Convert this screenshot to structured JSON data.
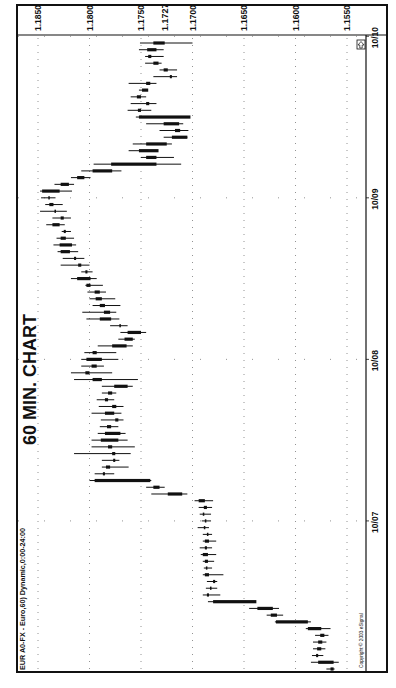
{
  "title": "60 MIN. CHART",
  "symbol_label": "EUR A0-FX - Euro,60) Dynamic,0:00-24:00",
  "copyright": "Copyright © 2003 eSignal",
  "last_price_marker": "1.1727",
  "colors": {
    "ink": "#111111",
    "grid": "#777777",
    "background": "#ffffff"
  },
  "chart_data": {
    "type": "ohlc",
    "title": "60 MIN. CHART",
    "subtitle": "EUR A0-FX - Euro,60) Dynamic,0:00-24:00",
    "xlabel": "Date",
    "ylabel": "EUR/USD",
    "orientation": "rotated 90° counter-clockwise (time runs bottom→top, price decreases left→right)",
    "ylim": [
      1.153,
      1.187
    ],
    "price_ticks": [
      "1.1850",
      "1.1800",
      "1.1750",
      "1.1700",
      "1.1650",
      "1.1600",
      "1.1550"
    ],
    "last_price": 1.1727,
    "date_ticks": [
      "10/07",
      "10/08",
      "10/09",
      "10/10"
    ],
    "grid": true,
    "legend": null,
    "bars": [
      {
        "o": 1.1566,
        "h": 1.157,
        "l": 1.1562,
        "c": 1.1563
      },
      {
        "o": 1.1563,
        "h": 1.1585,
        "l": 1.1558,
        "c": 1.1578
      },
      {
        "o": 1.158,
        "h": 1.1584,
        "l": 1.1573,
        "c": 1.1578
      },
      {
        "o": 1.1575,
        "h": 1.1583,
        "l": 1.1571,
        "c": 1.1579
      },
      {
        "o": 1.1578,
        "h": 1.1583,
        "l": 1.157,
        "c": 1.1574
      },
      {
        "o": 1.1572,
        "h": 1.1581,
        "l": 1.1568,
        "c": 1.1576
      },
      {
        "o": 1.1575,
        "h": 1.159,
        "l": 1.1566,
        "c": 1.1588
      },
      {
        "o": 1.1588,
        "h": 1.162,
        "l": 1.1585,
        "c": 1.1619
      },
      {
        "o": 1.1618,
        "h": 1.1628,
        "l": 1.1612,
        "c": 1.1624
      },
      {
        "o": 1.1622,
        "h": 1.1645,
        "l": 1.1616,
        "c": 1.1637
      },
      {
        "o": 1.1638,
        "h": 1.1685,
        "l": 1.1678,
        "c": 1.168
      },
      {
        "o": 1.1684,
        "h": 1.169,
        "l": 1.1673,
        "c": 1.1686
      },
      {
        "o": 1.1683,
        "h": 1.1687,
        "l": 1.1676,
        "c": 1.1682
      },
      {
        "o": 1.168,
        "h": 1.1686,
        "l": 1.1676,
        "c": 1.1678
      },
      {
        "o": 1.1684,
        "h": 1.169,
        "l": 1.167,
        "c": 1.1688
      },
      {
        "o": 1.1686,
        "h": 1.1689,
        "l": 1.1681,
        "c": 1.1687
      },
      {
        "o": 1.1685,
        "h": 1.169,
        "l": 1.1679,
        "c": 1.1688
      },
      {
        "o": 1.1685,
        "h": 1.1692,
        "l": 1.1677,
        "c": 1.169
      },
      {
        "o": 1.1686,
        "h": 1.1693,
        "l": 1.1681,
        "c": 1.1688
      },
      {
        "o": 1.1684,
        "h": 1.169,
        "l": 1.1677,
        "c": 1.1688
      },
      {
        "o": 1.1686,
        "h": 1.169,
        "l": 1.1681,
        "c": 1.1686
      },
      {
        "o": 1.1688,
        "h": 1.1695,
        "l": 1.1684,
        "c": 1.1689
      },
      {
        "o": 1.1688,
        "h": 1.1691,
        "l": 1.1682,
        "c": 1.1687
      },
      {
        "o": 1.1689,
        "h": 1.1693,
        "l": 1.1682,
        "c": 1.169
      },
      {
        "o": 1.1686,
        "h": 1.1694,
        "l": 1.1681,
        "c": 1.1689
      },
      {
        "o": 1.1688,
        "h": 1.1698,
        "l": 1.168,
        "c": 1.1694
      },
      {
        "o": 1.171,
        "h": 1.174,
        "l": 1.1705,
        "c": 1.1724
      },
      {
        "o": 1.1738,
        "h": 1.1745,
        "l": 1.1727,
        "c": 1.1732
      },
      {
        "o": 1.1795,
        "h": 1.18,
        "l": 1.174,
        "c": 1.1741
      },
      {
        "o": 1.1787,
        "h": 1.1795,
        "l": 1.1776,
        "c": 1.1785
      },
      {
        "o": 1.178,
        "h": 1.1788,
        "l": 1.1762,
        "c": 1.1784
      },
      {
        "o": 1.1775,
        "h": 1.1788,
        "l": 1.1771,
        "c": 1.1777
      },
      {
        "o": 1.1778,
        "h": 1.1815,
        "l": 1.176,
        "c": 1.1775
      },
      {
        "o": 1.1778,
        "h": 1.1798,
        "l": 1.1756,
        "c": 1.1782
      },
      {
        "o": 1.1789,
        "h": 1.1798,
        "l": 1.1763,
        "c": 1.1772
      },
      {
        "o": 1.177,
        "h": 1.1792,
        "l": 1.1765,
        "c": 1.1785
      },
      {
        "o": 1.1783,
        "h": 1.179,
        "l": 1.1772,
        "c": 1.1779
      },
      {
        "o": 1.1772,
        "h": 1.1789,
        "l": 1.1767,
        "c": 1.1775
      },
      {
        "o": 1.1785,
        "h": 1.1798,
        "l": 1.1769,
        "c": 1.1776
      },
      {
        "o": 1.1774,
        "h": 1.1791,
        "l": 1.1767,
        "c": 1.1778
      },
      {
        "o": 1.1785,
        "h": 1.1793,
        "l": 1.1776,
        "c": 1.1782
      },
      {
        "o": 1.1778,
        "h": 1.1788,
        "l": 1.1774,
        "c": 1.1782
      },
      {
        "o": 1.1763,
        "h": 1.1788,
        "l": 1.1758,
        "c": 1.1776
      },
      {
        "o": 1.1788,
        "h": 1.1815,
        "l": 1.1753,
        "c": 1.1797
      },
      {
        "o": 1.18,
        "h": 1.1818,
        "l": 1.1778,
        "c": 1.1804
      },
      {
        "o": 1.1793,
        "h": 1.1808,
        "l": 1.1786,
        "c": 1.1798
      },
      {
        "o": 1.1788,
        "h": 1.1808,
        "l": 1.1772,
        "c": 1.1803
      },
      {
        "o": 1.1793,
        "h": 1.1805,
        "l": 1.1774,
        "c": 1.1797
      },
      {
        "o": 1.1764,
        "h": 1.1792,
        "l": 1.1758,
        "c": 1.1778
      },
      {
        "o": 1.1758,
        "h": 1.1772,
        "l": 1.1756,
        "c": 1.1766
      },
      {
        "o": 1.1763,
        "h": 1.177,
        "l": 1.1745,
        "c": 1.175
      },
      {
        "o": 1.177,
        "h": 1.178,
        "l": 1.1763,
        "c": 1.1771
      },
      {
        "o": 1.179,
        "h": 1.1803,
        "l": 1.1771,
        "c": 1.1779
      },
      {
        "o": 1.178,
        "h": 1.1807,
        "l": 1.1774,
        "c": 1.1786
      },
      {
        "o": 1.1785,
        "h": 1.1797,
        "l": 1.177,
        "c": 1.179
      },
      {
        "o": 1.1788,
        "h": 1.18,
        "l": 1.1775,
        "c": 1.1794
      },
      {
        "o": 1.179,
        "h": 1.1802,
        "l": 1.1784,
        "c": 1.1795
      },
      {
        "o": 1.1799,
        "h": 1.1804,
        "l": 1.1787,
        "c": 1.1803
      },
      {
        "o": 1.1812,
        "h": 1.1818,
        "l": 1.1793,
        "c": 1.1799
      },
      {
        "o": 1.1802,
        "h": 1.1808,
        "l": 1.1797,
        "c": 1.1804
      },
      {
        "o": 1.1808,
        "h": 1.1828,
        "l": 1.18,
        "c": 1.1811
      },
      {
        "o": 1.1815,
        "h": 1.1826,
        "l": 1.1805,
        "c": 1.1813
      },
      {
        "o": 1.1819,
        "h": 1.1831,
        "l": 1.1811,
        "c": 1.1828
      },
      {
        "o": 1.1817,
        "h": 1.1835,
        "l": 1.1813,
        "c": 1.1829
      },
      {
        "o": 1.1828,
        "h": 1.1832,
        "l": 1.1815,
        "c": 1.1823
      },
      {
        "o": 1.1823,
        "h": 1.1827,
        "l": 1.1818,
        "c": 1.1825
      },
      {
        "o": 1.1829,
        "h": 1.1842,
        "l": 1.1824,
        "c": 1.1836
      },
      {
        "o": 1.1828,
        "h": 1.1836,
        "l": 1.1818,
        "c": 1.1825
      },
      {
        "o": 1.1833,
        "h": 1.1848,
        "l": 1.1822,
        "c": 1.1834
      },
      {
        "o": 1.1835,
        "h": 1.1843,
        "l": 1.1826,
        "c": 1.1839
      },
      {
        "o": 1.1839,
        "h": 1.1847,
        "l": 1.1833,
        "c": 1.184
      },
      {
        "o": 1.1846,
        "h": 1.1848,
        "l": 1.1817,
        "c": 1.1829
      },
      {
        "o": 1.182,
        "h": 1.1834,
        "l": 1.1815,
        "c": 1.1828
      },
      {
        "o": 1.1805,
        "h": 1.1818,
        "l": 1.1799,
        "c": 1.1812
      },
      {
        "o": 1.1797,
        "h": 1.1808,
        "l": 1.1769,
        "c": 1.1778
      },
      {
        "o": 1.1779,
        "h": 1.1796,
        "l": 1.1711,
        "c": 1.1735
      },
      {
        "o": 1.1735,
        "h": 1.175,
        "l": 1.1718,
        "c": 1.1745
      },
      {
        "o": 1.1733,
        "h": 1.1762,
        "l": 1.1737,
        "c": 1.1752
      },
      {
        "o": 1.1745,
        "h": 1.1758,
        "l": 1.172,
        "c": 1.1725
      },
      {
        "o": 1.1705,
        "h": 1.1728,
        "l": 1.1705,
        "c": 1.172
      },
      {
        "o": 1.1717,
        "h": 1.1732,
        "l": 1.1704,
        "c": 1.1712
      },
      {
        "o": 1.1728,
        "h": 1.1745,
        "l": 1.1709,
        "c": 1.1713
      },
      {
        "o": 1.1702,
        "h": 1.1755,
        "l": 1.1703,
        "c": 1.1752
      },
      {
        "o": 1.1753,
        "h": 1.1763,
        "l": 1.174,
        "c": 1.175
      },
      {
        "o": 1.1742,
        "h": 1.176,
        "l": 1.1735,
        "c": 1.1745
      },
      {
        "o": 1.175,
        "h": 1.176,
        "l": 1.1745,
        "c": 1.1754
      },
      {
        "o": 1.1743,
        "h": 1.1752,
        "l": 1.1745,
        "c": 1.1749
      },
      {
        "o": 1.1745,
        "h": 1.1762,
        "l": 1.1735,
        "c": 1.1741
      },
      {
        "o": 1.172,
        "h": 1.1738,
        "l": 1.1715,
        "c": 1.1722
      },
      {
        "o": 1.1724,
        "h": 1.1732,
        "l": 1.1715,
        "c": 1.1728
      },
      {
        "o": 1.1733,
        "h": 1.1746,
        "l": 1.173,
        "c": 1.1738
      },
      {
        "o": 1.174,
        "h": 1.1746,
        "l": 1.1728,
        "c": 1.1743
      },
      {
        "o": 1.1735,
        "h": 1.1752,
        "l": 1.1728,
        "c": 1.1744
      },
      {
        "o": 1.1738,
        "h": 1.1751,
        "l": 1.17,
        "c": 1.1727
      }
    ]
  },
  "axes": {
    "price_labels": [
      {
        "text": "1.1850",
        "value": 1.185
      },
      {
        "text": "1.1800",
        "value": 1.18
      },
      {
        "text": "1.1750",
        "value": 1.175
      },
      {
        "text": "1.1700",
        "value": 1.17
      },
      {
        "text": "1.1650",
        "value": 1.165
      },
      {
        "text": "1.1600",
        "value": 1.16
      },
      {
        "text": "1.1550",
        "value": 1.155
      }
    ],
    "date_labels": [
      {
        "text": "10/07",
        "bar_index": 22
      },
      {
        "text": "10/08",
        "bar_index": 46
      },
      {
        "text": "10/09",
        "bar_index": 70
      },
      {
        "text": "10/10",
        "bar_index": 94
      }
    ]
  }
}
